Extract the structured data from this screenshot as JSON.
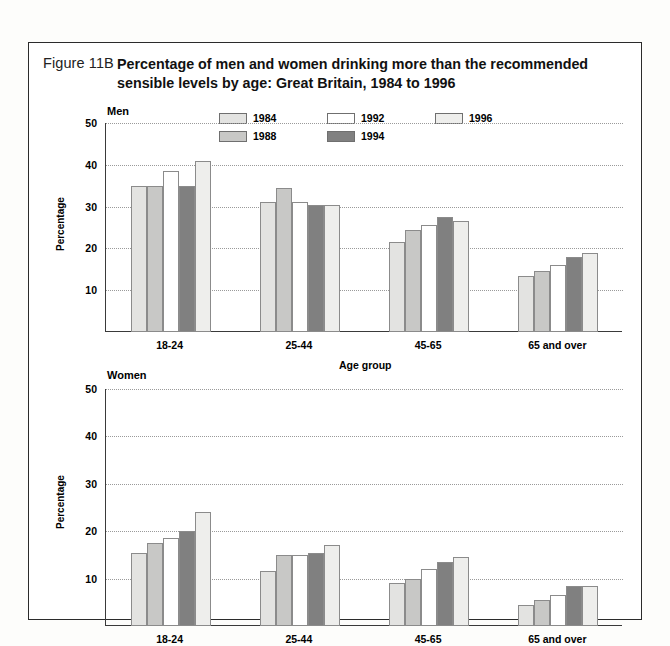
{
  "figure": {
    "number": "Figure 11B",
    "title": "Percentage of men and women drinking more than the recommended sensible levels by age: Great Britain, 1984 to 1996"
  },
  "legend": {
    "position": "top-center",
    "entries": [
      {
        "label": "1984",
        "color": "#e3e3e1"
      },
      {
        "label": "1988",
        "color": "#c8c8c6"
      },
      {
        "label": "1992",
        "color": "#ffffff"
      },
      {
        "label": "1994",
        "color": "#808080"
      },
      {
        "label": "1996",
        "color": "#eeeeec"
      }
    ]
  },
  "chart_data": [
    {
      "type": "bar",
      "title": "Men",
      "xlabel": "Age group",
      "ylabel": "Percentage",
      "categories": [
        "18-24",
        "25-44",
        "45-65",
        "65 and over"
      ],
      "ylim": [
        0,
        50
      ],
      "yticks": [
        10,
        20,
        30,
        40,
        50
      ],
      "grid": true,
      "series": [
        {
          "name": "1984",
          "color": "#e3e3e1",
          "values": [
            35.0,
            31.0,
            21.5,
            13.5
          ]
        },
        {
          "name": "1988",
          "color": "#c8c8c6",
          "values": [
            35.0,
            34.5,
            24.5,
            14.5
          ]
        },
        {
          "name": "1992",
          "color": "#ffffff",
          "values": [
            38.5,
            31.0,
            25.5,
            16.0
          ]
        },
        {
          "name": "1994",
          "color": "#808080",
          "values": [
            35.0,
            30.5,
            27.5,
            18.0
          ]
        },
        {
          "name": "1996",
          "color": "#eeeeec",
          "values": [
            41.0,
            30.5,
            26.5,
            19.0
          ]
        }
      ]
    },
    {
      "type": "bar",
      "title": "Women",
      "xlabel": "Age group",
      "ylabel": "Percentage",
      "categories": [
        "18-24",
        "25-44",
        "45-65",
        "65 and over"
      ],
      "ylim": [
        0,
        50
      ],
      "yticks": [
        10,
        20,
        30,
        40,
        50
      ],
      "grid": true,
      "series": [
        {
          "name": "1984",
          "color": "#e3e3e1",
          "values": [
            15.5,
            11.5,
            9.0,
            4.5
          ]
        },
        {
          "name": "1988",
          "color": "#c8c8c6",
          "values": [
            17.5,
            15.0,
            10.0,
            5.5
          ]
        },
        {
          "name": "1992",
          "color": "#ffffff",
          "values": [
            18.5,
            15.0,
            12.0,
            6.5
          ]
        },
        {
          "name": "1994",
          "color": "#808080",
          "values": [
            20.0,
            15.5,
            13.5,
            8.5
          ]
        },
        {
          "name": "1996",
          "color": "#eeeeec",
          "values": [
            24.0,
            17.0,
            14.5,
            8.5
          ]
        }
      ]
    }
  ]
}
